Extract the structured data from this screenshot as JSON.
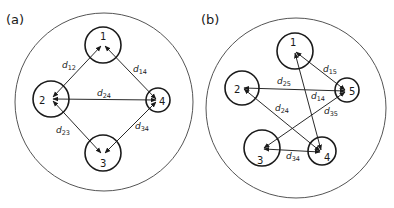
{
  "panels": [
    {
      "label": "(a)",
      "nodes": [
        {
          "id": "1",
          "label": "1"
        },
        {
          "id": "2",
          "label": "2"
        },
        {
          "id": "3",
          "label": "3"
        },
        {
          "id": "4",
          "label": "4"
        }
      ],
      "edges": [
        {
          "label": "d",
          "sub": "12"
        },
        {
          "label": "d",
          "sub": "14"
        },
        {
          "label": "d",
          "sub": "24"
        },
        {
          "label": "d",
          "sub": "23"
        },
        {
          "label": "d",
          "sub": "34"
        }
      ]
    },
    {
      "label": "(b)",
      "nodes": [
        {
          "id": "1",
          "label": "1"
        },
        {
          "id": "2",
          "label": "2"
        },
        {
          "id": "3",
          "label": "3"
        },
        {
          "id": "4",
          "label": "4"
        },
        {
          "id": "5",
          "label": "5"
        }
      ],
      "edges": [
        {
          "label": "d",
          "sub": "15"
        },
        {
          "label": "d",
          "sub": "25"
        },
        {
          "label": "d",
          "sub": "14"
        },
        {
          "label": "d",
          "sub": "24"
        },
        {
          "label": "d",
          "sub": "35"
        },
        {
          "label": "d",
          "sub": "34"
        }
      ]
    }
  ]
}
